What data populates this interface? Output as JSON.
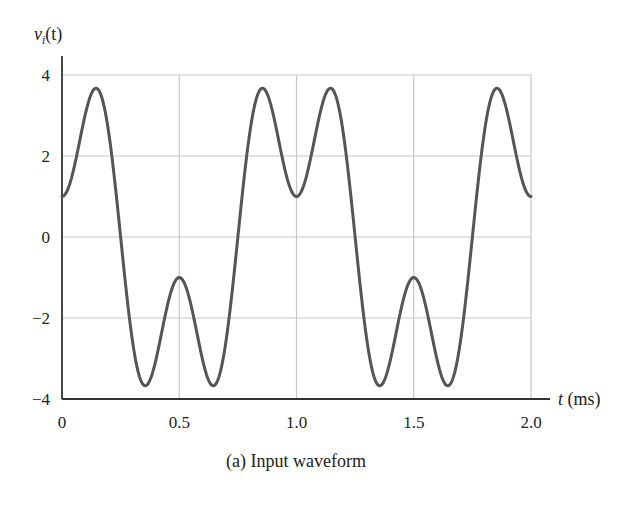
{
  "chart_data": {
    "type": "line",
    "title": "(a) Input waveform",
    "xlabel": "t (ms)",
    "ylabel": "v_i(t)",
    "xlim": [
      0,
      2.0
    ],
    "ylim": [
      -4,
      4
    ],
    "xticks": [
      0,
      0.5,
      1.0,
      1.5,
      2.0
    ],
    "xtick_labels": [
      "0",
      "0.5",
      "1.0",
      "1.5",
      "2.0"
    ],
    "yticks": [
      4,
      2,
      0,
      -2,
      -4
    ],
    "ytick_labels": [
      "4",
      "2",
      "0",
      "−2",
      "−4"
    ],
    "grid": true,
    "legend": null,
    "series": [
      {
        "name": "v_i(t)",
        "expression": "3cos(2πt) − 2cos(6πt), t in ms",
        "color": "#555555",
        "x": [
          0,
          0.05,
          0.1,
          0.15,
          0.2,
          0.25,
          0.3,
          0.35,
          0.4,
          0.45,
          0.5,
          0.55,
          0.6,
          0.65,
          0.7,
          0.75,
          0.8,
          0.85,
          0.9,
          0.95,
          1.0,
          1.05,
          1.1,
          1.15,
          1.2,
          1.25,
          1.3,
          1.35,
          1.4,
          1.45,
          1.5,
          1.55,
          1.6,
          1.65,
          1.7,
          1.75,
          1.8,
          1.85,
          1.9,
          1.95,
          2.0
        ],
        "y": [
          1.0,
          2.03,
          3.05,
          3.67,
          3.1,
          0.0,
          -3.1,
          -3.67,
          -3.05,
          -2.03,
          -1.0,
          -2.03,
          -3.05,
          -3.67,
          -3.1,
          0.0,
          3.1,
          3.67,
          3.05,
          2.03,
          1.0,
          2.03,
          3.05,
          3.67,
          3.1,
          0.0,
          -3.1,
          -3.67,
          -3.05,
          -2.03,
          -1.0,
          -2.03,
          -3.05,
          -3.67,
          -3.1,
          0.0,
          3.1,
          3.67,
          3.05,
          2.03,
          1.0
        ]
      }
    ]
  },
  "labels": {
    "ylabel_main": "v",
    "ylabel_sub": "i",
    "ylabel_rest": "(t)",
    "xlabel_var": "t",
    "xlabel_unit": " (ms)",
    "caption": "(a) Input waveform"
  },
  "colors": {
    "curve": "#555555",
    "grid": "#c8c8c8",
    "axis": "#333333"
  }
}
